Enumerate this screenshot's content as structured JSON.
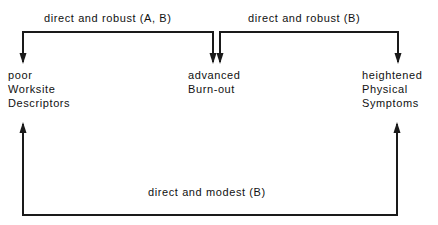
{
  "nodes": {
    "worksite": {
      "lines": [
        "poor",
        "Worksite",
        "Descriptors"
      ]
    },
    "burnout": {
      "lines": [
        "advanced",
        "Burn-out"
      ]
    },
    "symptoms": {
      "lines": [
        "heightened",
        "Physical",
        "Symptoms"
      ]
    }
  },
  "edges": {
    "worksite_to_burnout": {
      "label": "direct and robust (A, B)"
    },
    "burnout_to_symptoms": {
      "label": "direct and robust (B)"
    },
    "worksite_to_symptoms": {
      "label": "direct and modest (B)"
    }
  },
  "colors": {
    "line": "#1a1a1a",
    "text": "#111111",
    "background": "#ffffff"
  }
}
